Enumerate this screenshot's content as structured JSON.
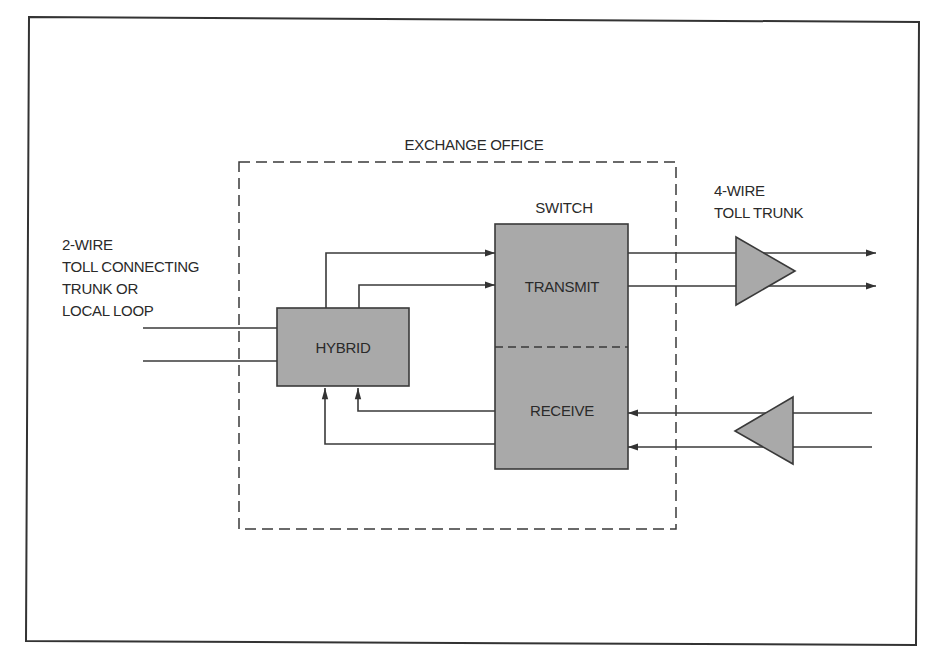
{
  "diagram": {
    "colors": {
      "block_fill": "#a9a9a9",
      "line": "#3a3a3a",
      "background": "#ffffff"
    },
    "labels": {
      "exchange_office": "EXCHANGE OFFICE",
      "switch": "SWITCH",
      "transmit": "TRANSMIT",
      "receive": "RECEIVE",
      "hybrid": "HYBRID",
      "two_wire": [
        "2-WIRE",
        "TOLL CONNECTING",
        "TRUNK OR",
        "LOCAL LOOP"
      ],
      "four_wire": [
        "4-WIRE",
        "TOLL TRUNK"
      ]
    },
    "nodes": [
      {
        "id": "hybrid",
        "label": "HYBRID",
        "shape": "rectangle"
      },
      {
        "id": "switch-transmit",
        "label": "TRANSMIT",
        "shape": "rectangle"
      },
      {
        "id": "switch-receive",
        "label": "RECEIVE",
        "shape": "rectangle"
      },
      {
        "id": "transmit-amplifier",
        "label": "",
        "shape": "triangle-right"
      },
      {
        "id": "receive-amplifier",
        "label": "",
        "shape": "triangle-left"
      }
    ],
    "edges": [
      {
        "from": "2-wire-line",
        "to": "hybrid",
        "count": 2
      },
      {
        "from": "hybrid",
        "to": "switch-transmit",
        "count": 2
      },
      {
        "from": "switch-transmit",
        "to": "transmit-amplifier",
        "count": 2
      },
      {
        "from": "transmit-amplifier",
        "to": "4-wire-out",
        "count": 2
      },
      {
        "from": "4-wire-in",
        "to": "receive-amplifier",
        "count": 2
      },
      {
        "from": "receive-amplifier",
        "to": "switch-receive",
        "count": 2
      },
      {
        "from": "switch-receive",
        "to": "hybrid",
        "count": 2
      }
    ]
  }
}
